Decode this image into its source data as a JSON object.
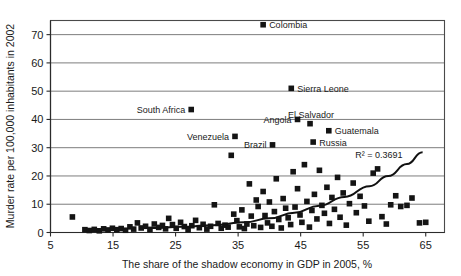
{
  "chart_data": {
    "type": "scatter",
    "title": "",
    "xlabel": "The share of the shadow economy in GDP in 2005, %",
    "ylabel": "Murder rate per 100,000 inhabitants in 2002",
    "xlim": [
      5,
      68
    ],
    "ylim": [
      0,
      75
    ],
    "xticks": [
      5,
      15,
      25,
      35,
      45,
      55,
      65
    ],
    "yticks": [
      0,
      10,
      20,
      30,
      40,
      50,
      60,
      70
    ],
    "grid": "horizontal",
    "legend": "none",
    "annotations": [
      {
        "text": "R² = 0.3691",
        "x": 57.5,
        "y": 26.5
      }
    ],
    "trendline": {
      "type": "exponential",
      "label": "R² = 0.3691",
      "r_squared": 0.3691,
      "points": [
        {
          "x": 21.0,
          "y": 1.6
        },
        {
          "x": 26.0,
          "y": 2.0
        },
        {
          "x": 31.0,
          "y": 2.6
        },
        {
          "x": 36.0,
          "y": 3.6
        },
        {
          "x": 40.0,
          "y": 5.0
        },
        {
          "x": 44.0,
          "y": 7.0
        },
        {
          "x": 48.0,
          "y": 9.5
        },
        {
          "x": 52.0,
          "y": 12.6
        },
        {
          "x": 56.0,
          "y": 16.4
        },
        {
          "x": 59.0,
          "y": 20.0
        },
        {
          "x": 62.0,
          "y": 24.2
        },
        {
          "x": 64.5,
          "y": 28.4
        }
      ]
    },
    "labeled_points": [
      {
        "label": "Colombia",
        "x": 39.0,
        "y": 73.5,
        "label_side": "right"
      },
      {
        "label": "Sierra Leone",
        "x": 43.5,
        "y": 51.0,
        "label_side": "right"
      },
      {
        "label": "South Africa",
        "x": 27.5,
        "y": 43.5,
        "label_side": "left"
      },
      {
        "label": "Angola",
        "x": 44.5,
        "y": 40.0,
        "label_side": "left"
      },
      {
        "label": "El Salvador",
        "x": 46.5,
        "y": 38.5,
        "label_side": "above"
      },
      {
        "label": "Guatemala",
        "x": 49.5,
        "y": 36.0,
        "label_side": "right"
      },
      {
        "label": "Venezuela",
        "x": 34.5,
        "y": 34.0,
        "label_side": "left"
      },
      {
        "label": "Russia",
        "x": 47.0,
        "y": 32.0,
        "label_side": "right"
      },
      {
        "label": "Brazil",
        "x": 40.5,
        "y": 31.0,
        "label_side": "left"
      }
    ],
    "points": [
      {
        "x": 8.5,
        "y": 5.5
      },
      {
        "x": 10.5,
        "y": 1.0
      },
      {
        "x": 11.2,
        "y": 0.7
      },
      {
        "x": 12.0,
        "y": 1.1
      },
      {
        "x": 12.8,
        "y": 0.6
      },
      {
        "x": 13.5,
        "y": 1.3
      },
      {
        "x": 14.2,
        "y": 0.9
      },
      {
        "x": 14.9,
        "y": 1.5
      },
      {
        "x": 15.6,
        "y": 1.0
      },
      {
        "x": 16.3,
        "y": 1.4
      },
      {
        "x": 17.0,
        "y": 0.8
      },
      {
        "x": 17.7,
        "y": 2.0
      },
      {
        "x": 18.3,
        "y": 1.2
      },
      {
        "x": 18.9,
        "y": 3.4
      },
      {
        "x": 19.5,
        "y": 1.6
      },
      {
        "x": 20.2,
        "y": 2.2
      },
      {
        "x": 20.9,
        "y": 1.1
      },
      {
        "x": 21.6,
        "y": 3.0
      },
      {
        "x": 22.3,
        "y": 1.8
      },
      {
        "x": 22.9,
        "y": 2.5
      },
      {
        "x": 23.4,
        "y": 1.3
      },
      {
        "x": 23.9,
        "y": 5.0
      },
      {
        "x": 24.5,
        "y": 2.8
      },
      {
        "x": 25.1,
        "y": 1.5
      },
      {
        "x": 25.8,
        "y": 3.6
      },
      {
        "x": 26.4,
        "y": 2.1
      },
      {
        "x": 27.0,
        "y": 1.0
      },
      {
        "x": 27.6,
        "y": 2.4
      },
      {
        "x": 28.2,
        "y": 4.3
      },
      {
        "x": 28.8,
        "y": 1.7
      },
      {
        "x": 29.4,
        "y": 2.9
      },
      {
        "x": 30.0,
        "y": 1.2
      },
      {
        "x": 30.6,
        "y": 2.2
      },
      {
        "x": 31.2,
        "y": 9.8
      },
      {
        "x": 31.8,
        "y": 3.2
      },
      {
        "x": 32.3,
        "y": 1.5
      },
      {
        "x": 32.9,
        "y": 2.6
      },
      {
        "x": 33.4,
        "y": 1.9
      },
      {
        "x": 33.9,
        "y": 27.3
      },
      {
        "x": 34.3,
        "y": 6.5
      },
      {
        "x": 34.8,
        "y": 4.2
      },
      {
        "x": 35.2,
        "y": 2.0
      },
      {
        "x": 35.6,
        "y": 8.0
      },
      {
        "x": 36.0,
        "y": 1.4
      },
      {
        "x": 36.4,
        "y": 3.0
      },
      {
        "x": 36.8,
        "y": 17.2
      },
      {
        "x": 37.1,
        "y": 5.8
      },
      {
        "x": 37.5,
        "y": 2.4
      },
      {
        "x": 37.9,
        "y": 11.5
      },
      {
        "x": 38.2,
        "y": 9.2
      },
      {
        "x": 38.6,
        "y": 1.8
      },
      {
        "x": 39.0,
        "y": 14.5
      },
      {
        "x": 39.3,
        "y": 6.0
      },
      {
        "x": 39.7,
        "y": 3.4
      },
      {
        "x": 40.0,
        "y": 10.8
      },
      {
        "x": 40.4,
        "y": 2.2
      },
      {
        "x": 40.8,
        "y": 7.4
      },
      {
        "x": 41.1,
        "y": 19.0
      },
      {
        "x": 41.5,
        "y": 4.6
      },
      {
        "x": 41.9,
        "y": 1.6
      },
      {
        "x": 42.2,
        "y": 12.0
      },
      {
        "x": 42.6,
        "y": 8.6
      },
      {
        "x": 43.0,
        "y": 5.2
      },
      {
        "x": 43.4,
        "y": 2.8
      },
      {
        "x": 43.8,
        "y": 21.5
      },
      {
        "x": 44.1,
        "y": 9.0
      },
      {
        "x": 44.5,
        "y": 15.5
      },
      {
        "x": 44.9,
        "y": 6.2
      },
      {
        "x": 45.2,
        "y": 3.6
      },
      {
        "x": 45.6,
        "y": 24.0
      },
      {
        "x": 46.0,
        "y": 11.0
      },
      {
        "x": 46.4,
        "y": 1.9
      },
      {
        "x": 46.8,
        "y": 7.8
      },
      {
        "x": 47.2,
        "y": 13.5
      },
      {
        "x": 47.6,
        "y": 4.8
      },
      {
        "x": 48.0,
        "y": 22.0
      },
      {
        "x": 48.4,
        "y": 9.6
      },
      {
        "x": 48.8,
        "y": 6.8
      },
      {
        "x": 49.2,
        "y": 16.0
      },
      {
        "x": 49.6,
        "y": 3.2
      },
      {
        "x": 50.0,
        "y": 12.4
      },
      {
        "x": 50.4,
        "y": 8.2
      },
      {
        "x": 50.9,
        "y": 19.5
      },
      {
        "x": 51.3,
        "y": 5.4
      },
      {
        "x": 51.8,
        "y": 14.0
      },
      {
        "x": 52.3,
        "y": 2.6
      },
      {
        "x": 52.8,
        "y": 10.2
      },
      {
        "x": 53.4,
        "y": 17.5
      },
      {
        "x": 53.9,
        "y": 7.0
      },
      {
        "x": 54.5,
        "y": 12.8
      },
      {
        "x": 55.2,
        "y": 9.4
      },
      {
        "x": 55.9,
        "y": 4.0
      },
      {
        "x": 56.6,
        "y": 21.0
      },
      {
        "x": 57.3,
        "y": 22.5
      },
      {
        "x": 58.0,
        "y": 5.6
      },
      {
        "x": 58.7,
        "y": 3.0
      },
      {
        "x": 59.4,
        "y": 9.8
      },
      {
        "x": 60.2,
        "y": 13.0
      },
      {
        "x": 61.0,
        "y": 9.2
      },
      {
        "x": 62.0,
        "y": 9.6
      },
      {
        "x": 62.8,
        "y": 12.2
      },
      {
        "x": 64.0,
        "y": 3.4
      },
      {
        "x": 65.0,
        "y": 3.6
      }
    ]
  }
}
